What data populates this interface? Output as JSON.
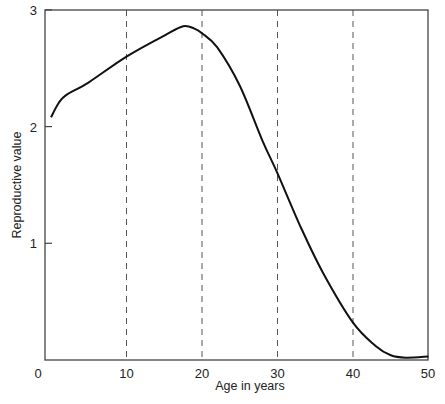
{
  "chart_data": {
    "type": "line",
    "title": "",
    "xlabel": "Age in years",
    "ylabel": "Reproductive value",
    "xlim": [
      0,
      50
    ],
    "ylim": [
      0,
      3
    ],
    "x_ticks": [
      "0",
      "10",
      "20",
      "30",
      "40",
      "50"
    ],
    "y_ticks": [
      "1",
      "2",
      "3"
    ],
    "grid": {
      "vertical_dashed_at": [
        10,
        20,
        30,
        40
      ],
      "horizontal": false
    },
    "legend": null,
    "series": [
      {
        "name": "Reproductive value",
        "x": [
          0,
          1,
          2,
          5,
          10,
          15,
          17.5,
          19,
          20,
          22,
          25,
          28,
          30,
          33,
          36,
          40,
          43,
          45,
          47,
          50
        ],
        "y": [
          2.08,
          2.2,
          2.27,
          2.38,
          2.6,
          2.78,
          2.86,
          2.84,
          2.8,
          2.68,
          2.35,
          1.88,
          1.6,
          1.15,
          0.75,
          0.32,
          0.12,
          0.04,
          0.02,
          0.03
        ]
      }
    ]
  }
}
